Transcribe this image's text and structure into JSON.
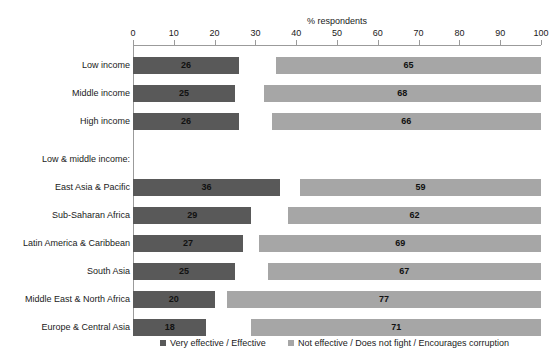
{
  "chart_data": {
    "type": "bar",
    "orientation": "horizontal",
    "title": "",
    "subtitle": "",
    "xlabel": "% respondents",
    "ylabel": "",
    "xlim": [
      0,
      100
    ],
    "xticks": [
      0,
      10,
      20,
      30,
      40,
      50,
      60,
      70,
      80,
      90,
      100
    ],
    "grid": false,
    "legend_position": "bottom",
    "stacked_from_ends": true,
    "categories": [
      "Low income",
      "Middle income",
      "High income",
      "East Asia & Pacific",
      "Sub-Saharan Africa",
      "Latin America & Caribbean",
      "South Asia",
      "Middle East & North Africa",
      "Europe & Central Asia"
    ],
    "group_heading": "Low & middle income:",
    "group_heading_after_index": 2,
    "series": [
      {
        "name": "Very effective / Effective",
        "color": "#595959",
        "anchor": "left",
        "values": [
          26,
          25,
          26,
          36,
          29,
          27,
          25,
          20,
          18
        ]
      },
      {
        "name": "Not effective / Does not fight / Encourages corruption",
        "color": "#a6a6a6",
        "anchor": "right",
        "values": [
          65,
          68,
          66,
          59,
          62,
          69,
          67,
          77,
          71
        ]
      }
    ]
  },
  "axis": {
    "title": "% respondents",
    "tick_labels": [
      "0",
      "10",
      "20",
      "30",
      "40",
      "50",
      "60",
      "70",
      "80",
      "90",
      "100"
    ]
  },
  "labels": {
    "rows": [
      "Low income",
      "Middle income",
      "High income",
      "East Asia & Pacific",
      "Sub-Saharan Africa",
      "Latin America & Caribbean",
      "South Asia",
      "Middle East & North Africa",
      "Europe & Central Asia"
    ],
    "group_heading": "Low & middle income:"
  },
  "values": {
    "dark": [
      "26",
      "25",
      "26",
      "36",
      "29",
      "27",
      "25",
      "20",
      "18"
    ],
    "light": [
      "65",
      "68",
      "66",
      "59",
      "62",
      "69",
      "67",
      "77",
      "71"
    ]
  },
  "legend": {
    "items": [
      {
        "label": "Very effective / Effective",
        "color": "#595959"
      },
      {
        "label": "Not effective / Does not fight / Encourages corruption",
        "color": "#a6a6a6"
      }
    ]
  }
}
